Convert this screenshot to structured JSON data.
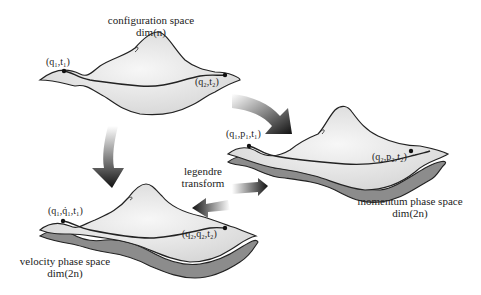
{
  "spaces": {
    "configuration": {
      "title": "configuration space",
      "dim": "dim(n)",
      "start_label": "(q₁,t₁)",
      "end_label": "(q₂,t₂)"
    },
    "momentum": {
      "title": "momentum phase space",
      "dim": "dim(2n)",
      "start_label": "(q₁,p₁,t₁)",
      "end_label": "(q₂,p₂,t₂)"
    },
    "velocity": {
      "title": "velocity phase space",
      "dim": "dim(2n)",
      "start_label": "(q₁,q̇₁,t₁)",
      "end_label": "(q₂,q̇₂,t₂)"
    }
  },
  "transform": {
    "line1": "legendre",
    "line2": "transform"
  },
  "colors": {
    "surface": "#e6e6e6",
    "shadow_layer": "#8c8c8c",
    "outline": "#222222",
    "arrow_dark": "#111111"
  }
}
